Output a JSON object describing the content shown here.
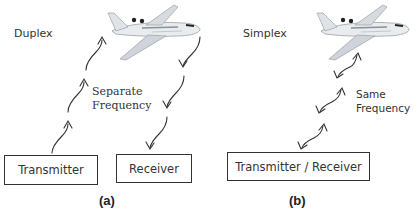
{
  "panels": [
    {
      "id": "a",
      "mode_label": "Duplex",
      "frequency_label_line1": "Separate",
      "frequency_label_line2": "Frequency",
      "boxes": [
        "Transmitter",
        "Receiver"
      ],
      "caption": "(a)"
    },
    {
      "id": "b",
      "mode_label": "Simplex",
      "frequency_label_line1": "Same",
      "frequency_label_line2": "Frequency",
      "boxes": [
        "Transmitter / Receiver"
      ],
      "caption": "(b)"
    }
  ],
  "icons": {
    "aircraft": "airplane-icon",
    "uplink": "wavy-arrow-up",
    "downlink": "wavy-arrow-down",
    "bidirectional": "wavy-double-arrow"
  }
}
